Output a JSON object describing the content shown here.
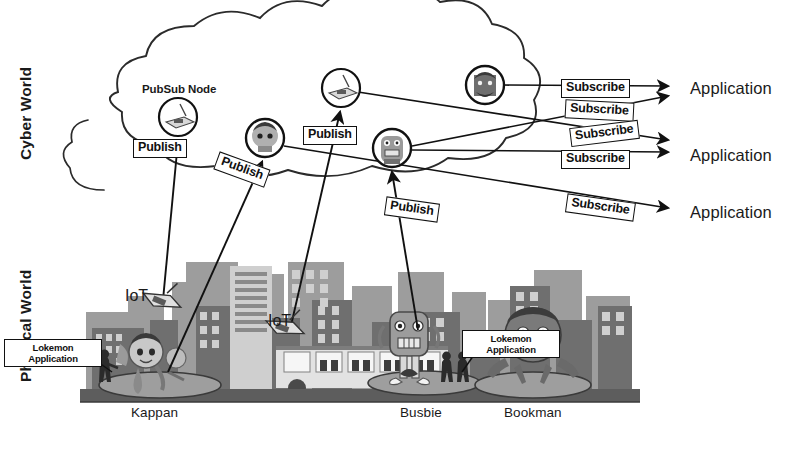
{
  "diagram": {
    "regions": [
      {
        "id": "cyber",
        "label": "Cyber World"
      },
      {
        "id": "physical",
        "label": "Physical World"
      }
    ],
    "node_caption": "PubSub Node",
    "publish_label": "Publish",
    "subscribe_label": "Subscribe",
    "iot_label": "IoT",
    "lokemon_app": {
      "line1": "Lokemon",
      "line2": "Application"
    },
    "application_label": "Application",
    "publish_edges": [
      {
        "id": "p1",
        "label": "Publish",
        "x": 133,
        "y": 139,
        "rotate": 0,
        "from": "iot-device-1",
        "to": "pubsub-node-1"
      },
      {
        "id": "p2",
        "label": "Publish",
        "x": 215,
        "y": 160,
        "rotate": 20,
        "from": "kappan",
        "to": "pubsub-node-2"
      },
      {
        "id": "p3",
        "label": "Publish",
        "x": 303,
        "y": 126,
        "rotate": 0,
        "from": "iot-device-2",
        "to": "pubsub-node-3"
      },
      {
        "id": "p4",
        "label": "Publish",
        "x": 385,
        "y": 200,
        "rotate": 8,
        "from": "busbie",
        "to": "pubsub-node-4"
      }
    ],
    "subscribe_edges": [
      {
        "id": "s1",
        "label": "Subscribe",
        "x": 561,
        "y": 79,
        "rotate": 0,
        "to": "application-1"
      },
      {
        "id": "s2",
        "label": "Subscribe",
        "x": 565,
        "y": 101,
        "rotate": 3,
        "to": "application-1"
      },
      {
        "id": "s3",
        "label": "Subscribe",
        "x": 570,
        "y": 124,
        "rotate": -7,
        "to": "application-2"
      },
      {
        "id": "s4",
        "label": "Subscribe",
        "x": 561,
        "y": 150,
        "rotate": 0,
        "to": "application-2"
      },
      {
        "id": "s5",
        "label": "Subscribe",
        "x": 566,
        "y": 198,
        "rotate": 8,
        "to": "application-3"
      }
    ],
    "applications": [
      {
        "id": "application-1",
        "label": "Application",
        "x": 690,
        "y": 80
      },
      {
        "id": "application-2",
        "label": "Application",
        "x": 690,
        "y": 147
      },
      {
        "id": "application-3",
        "label": "Application",
        "x": 690,
        "y": 204
      }
    ],
    "pubsub_nodes": [
      {
        "id": "pubsub-node-1",
        "kind": "router",
        "cx": 178,
        "cy": 117,
        "r": 19,
        "caption": "PubSub Node"
      },
      {
        "id": "pubsub-node-2",
        "kind": "avatar-kappan",
        "cx": 265,
        "cy": 138,
        "r": 19,
        "caption": ""
      },
      {
        "id": "pubsub-node-3",
        "kind": "router",
        "cx": 341,
        "cy": 88,
        "r": 19,
        "caption": ""
      },
      {
        "id": "pubsub-node-4",
        "kind": "avatar-busbie",
        "cx": 392,
        "cy": 148,
        "r": 19,
        "caption": ""
      },
      {
        "id": "pubsub-node-5",
        "kind": "avatar-bookman",
        "cx": 485,
        "cy": 85,
        "r": 19,
        "caption": ""
      }
    ],
    "iot_devices": [
      {
        "id": "iot-device-1",
        "label": "IoT",
        "label_x": 125,
        "label_y": 288,
        "x": 160,
        "y": 300,
        "rotate": 22
      },
      {
        "id": "iot-device-2",
        "label": "IoT",
        "label_x": 268,
        "label_y": 313,
        "x": 283,
        "y": 327,
        "rotate": 20
      }
    ],
    "lokemon_callouts": [
      {
        "id": "callout-left",
        "line1": "Lokemon",
        "line2": "Application",
        "x": 48,
        "y": 341
      },
      {
        "id": "callout-right",
        "line1": "Lokemon",
        "line2": "Application",
        "x": 462,
        "y": 332
      }
    ],
    "characters": [
      {
        "id": "kappan",
        "name": "Kappan",
        "x": 153,
        "y": 412
      },
      {
        "id": "busbie",
        "name": "Busbie",
        "x": 421,
        "y": 412
      },
      {
        "id": "bookman",
        "name": "Bookman",
        "x": 530,
        "y": 412
      }
    ],
    "colors": {
      "ink": "#111111",
      "cloud_stroke": "#2b2b2b",
      "city_dark": "#6b6b6b",
      "city_mid": "#8e8e8e",
      "city_light": "#b4b4b4",
      "ground": "#5d5d5d",
      "platform": "#9a9a9a",
      "background": "#ffffff"
    }
  }
}
